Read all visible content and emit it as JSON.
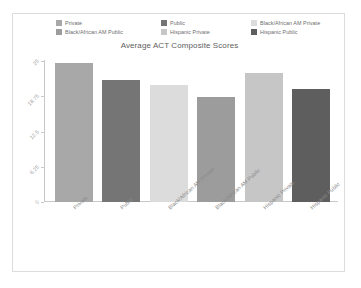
{
  "chart_data": {
    "type": "bar",
    "title": "Average ACT Composite Scores",
    "xlabel": "",
    "ylabel": "",
    "ylim": [
      0,
      25
    ],
    "grid": false,
    "legend_position": "top",
    "categories": [
      "Private",
      "Public",
      "Black/African AM Private",
      "Black/African AM Public",
      "Hispanic Private",
      "Hispanic Public"
    ],
    "values": [
      24.6,
      21.6,
      20.7,
      18.6,
      22.8,
      20.1
    ],
    "colors": [
      "#a8a8a8",
      "#757575",
      "#dcdcdc",
      "#9c9c9c",
      "#c6c6c6",
      "#5e5e5e"
    ],
    "ytick_labels": [
      "25",
      "18.75",
      "12.5",
      "6.25",
      "0"
    ],
    "ytick_values": [
      25,
      18.75,
      12.5,
      6.25,
      0
    ],
    "legend": [
      {
        "label": "Private",
        "color": "#a8a8a8"
      },
      {
        "label": "Public",
        "color": "#757575"
      },
      {
        "label": "Black/African AM Private",
        "color": "#dcdcdc"
      },
      {
        "label": "Black/African AM Public",
        "color": "#9c9c9c"
      },
      {
        "label": "Hispanic Private",
        "color": "#c6c6c6"
      },
      {
        "label": "Hispanic Public",
        "color": "#5e5e5e"
      }
    ]
  }
}
